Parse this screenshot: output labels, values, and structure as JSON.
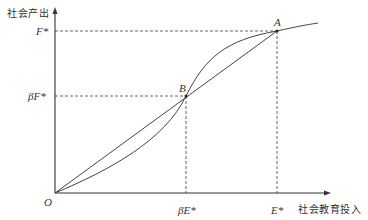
{
  "diagram": {
    "y_axis_label": "社会产出",
    "x_axis_label": "社会教育投入",
    "origin_label": "O",
    "y_ticks": [
      {
        "id": "F",
        "label": "F*"
      },
      {
        "id": "bF",
        "label": "βF*"
      }
    ],
    "x_ticks": [
      {
        "id": "bE",
        "label": "βE*"
      },
      {
        "id": "E",
        "label": "E*"
      }
    ],
    "points": [
      {
        "id": "A",
        "label": "A"
      },
      {
        "id": "B",
        "label": "B"
      }
    ],
    "curves": [
      {
        "name": "s-curve",
        "description": "S-shaped output curve from O through B and A"
      },
      {
        "name": "line-OA",
        "description": "straight line from O to A"
      }
    ],
    "colors": {
      "line": "#444444",
      "dashed": "#555555",
      "text": "#333333"
    }
  }
}
